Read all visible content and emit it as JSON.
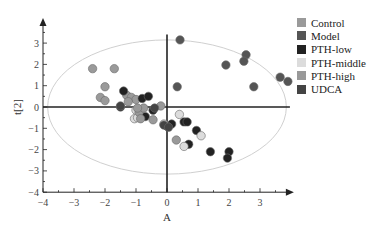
{
  "chart_data": {
    "type": "scatter",
    "title": "",
    "xlabel": "A",
    "ylabel": "t[2]",
    "xlim": [
      -4,
      3.9
    ],
    "ylim": [
      -4,
      3.9
    ],
    "x_ticks": [
      -4,
      -3,
      -2,
      -1,
      0,
      1,
      2,
      3
    ],
    "y_ticks": [
      -4,
      -3,
      -2,
      -1,
      0,
      1,
      2,
      3
    ],
    "grid": false,
    "legend_position": "right",
    "ellipse": {
      "cx": 0,
      "cy": 0,
      "rx": 3.85,
      "ry": 3.15,
      "color": "#d0d0d0"
    },
    "series": [
      {
        "name": "Control",
        "color": "#9a9a9a",
        "points": [
          [
            -2.4,
            1.8
          ],
          [
            -1.7,
            1.8
          ],
          [
            -2.0,
            0.95
          ],
          [
            -2.15,
            0.45
          ],
          [
            -2.0,
            0.3
          ],
          [
            -1.3,
            0.55
          ],
          [
            -1.15,
            0.45
          ],
          [
            -1.0,
            0.35
          ],
          [
            -1.25,
            0.25
          ]
        ]
      },
      {
        "name": "Model",
        "color": "#555555",
        "points": [
          [
            0.42,
            3.15
          ],
          [
            2.55,
            2.45
          ],
          [
            2.48,
            2.15
          ],
          [
            1.9,
            1.97
          ],
          [
            3.65,
            1.4
          ],
          [
            3.9,
            1.2
          ],
          [
            2.8,
            0.95
          ],
          [
            0.33,
            0.95
          ]
        ]
      },
      {
        "name": "PTH-low",
        "color": "#222222",
        "points": [
          [
            -1.4,
            0.75
          ],
          [
            -0.8,
            0.4
          ],
          [
            -0.6,
            0.5
          ],
          [
            -1.5,
            0.0
          ],
          [
            -0.45,
            -0.15
          ],
          [
            -0.7,
            -0.45
          ],
          [
            0.15,
            -0.8
          ],
          [
            0.55,
            -0.7
          ],
          [
            0.65,
            -0.7
          ],
          [
            0.95,
            -1.1
          ],
          [
            0.7,
            -1.75
          ],
          [
            1.4,
            -2.1
          ],
          [
            2.0,
            -2.1
          ],
          [
            1.95,
            -2.4
          ],
          [
            0.0,
            -0.9
          ]
        ]
      },
      {
        "name": "PTH-middle",
        "color": "#dcdcdc",
        "points": [
          [
            -1.0,
            -0.15
          ],
          [
            -1.05,
            -0.55
          ],
          [
            0.4,
            -0.35
          ],
          [
            -0.1,
            -0.8
          ],
          [
            1.1,
            -1.35
          ],
          [
            0.55,
            -1.85
          ],
          [
            -0.95,
            -0.5
          ]
        ]
      },
      {
        "name": "PTH-high",
        "color": "#999999",
        "points": [
          [
            -0.9,
            -0.25
          ],
          [
            -0.85,
            -0.55
          ],
          [
            -0.45,
            -0.6
          ],
          [
            -0.2,
            0.05
          ],
          [
            -0.75,
            -0.05
          ],
          [
            0.3,
            -1.55
          ],
          [
            -0.95,
            -0.05
          ]
        ]
      },
      {
        "name": "UDCA",
        "color": "#444444",
        "points": [
          [
            -1.5,
            0.05
          ],
          [
            -0.4,
            -0.05
          ],
          [
            -0.1,
            -0.85
          ],
          [
            0.05,
            -0.95
          ]
        ]
      }
    ]
  }
}
